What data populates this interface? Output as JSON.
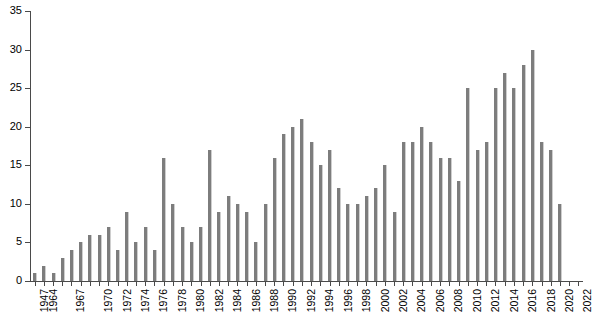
{
  "chart_data": {
    "type": "bar",
    "title": "",
    "subtitle": "",
    "xlabel": "",
    "ylabel": "",
    "ylim": [
      0,
      35
    ],
    "ytick_step": 5,
    "yticks": [
      0,
      5,
      10,
      15,
      20,
      25,
      30,
      35
    ],
    "grid": false,
    "legend": false,
    "legend_position": "none",
    "bar_color": "#7d7d7d",
    "axis_color": "#4a4a4a",
    "background_color": "#ffffff",
    "label_interval": "every other category, starting at 1947",
    "categories": [
      "1947",
      "1964",
      "1965",
      "1966",
      "1967",
      "1968",
      "1969",
      "1970",
      "1971",
      "1972",
      "1973",
      "1974",
      "1975",
      "1976",
      "1977",
      "1978",
      "1979",
      "1980",
      "1981",
      "1982",
      "1983",
      "1984",
      "1985",
      "1986",
      "1987",
      "1988",
      "1989",
      "1990",
      "1991",
      "1992",
      "1993",
      "1994",
      "1995",
      "1996",
      "1997",
      "1998",
      "1999",
      "2000",
      "2001",
      "2002",
      "2003",
      "2004",
      "2005",
      "2006",
      "2007",
      "2008",
      "2009",
      "2010",
      "2011",
      "2012",
      "2013",
      "2014",
      "2015",
      "2016",
      "2017",
      "2018",
      "2019",
      "2020",
      "2021",
      "2022"
    ],
    "values": [
      1,
      2,
      1,
      3,
      4,
      5,
      6,
      6,
      7,
      4,
      9,
      5,
      7,
      4,
      16,
      10,
      7,
      5,
      7,
      17,
      9,
      11,
      10,
      9,
      5,
      10,
      16,
      19,
      20,
      21,
      18,
      15,
      17,
      12,
      10,
      10,
      11,
      12,
      15,
      9,
      18,
      18,
      20,
      18,
      16,
      16,
      13,
      25,
      17,
      18,
      25,
      27,
      25,
      28,
      30,
      18,
      17,
      10,
      0,
      0
    ],
    "xtick_labels_shown": [
      "1947",
      "1964",
      "1967",
      "1970",
      "1972",
      "1974",
      "1976",
      "1978",
      "1980",
      "1982",
      "1984",
      "1986",
      "1988",
      "1990",
      "1992",
      "1994",
      "1996",
      "1998",
      "2000",
      "2002",
      "2004",
      "2006",
      "2008",
      "2010",
      "2012",
      "2014",
      "2016",
      "2018",
      "2020",
      "2022"
    ],
    "peak_value": 30,
    "min_value": 1
  },
  "axis": {
    "y_labels": [
      "0",
      "5",
      "10",
      "15",
      "20",
      "25",
      "30",
      "35"
    ]
  }
}
